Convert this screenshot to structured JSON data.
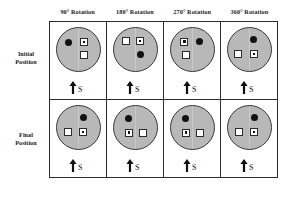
{
  "figure": {
    "column_headers": [
      "90° Rotation",
      "180° Rotation",
      "270° Rotation",
      "360° Rotation"
    ],
    "row_labels": {
      "initial": "Initial\nPosition",
      "initial_line1": "Initial",
      "initial_line2": "Position",
      "final_line1": "Final",
      "final_line2": "Position"
    },
    "marker_label": "S",
    "colors": {
      "disc_fill": "#b8b8b8",
      "disc_stroke": "#3a3a3a",
      "dot_fill": "#111111",
      "square_fill": "#ffffff",
      "square_stroke": "#2b2b2b",
      "grid_line": "#2b2b2b",
      "background": "#ffffff"
    },
    "cells": [
      {
        "row": "Initial Position",
        "column": "90° Rotation",
        "marker": "S",
        "objects": [
          {
            "type": "filled-dot",
            "x": 28,
            "y": 33
          },
          {
            "type": "square-with-dot",
            "x": 64,
            "y": 33
          },
          {
            "type": "plain-square",
            "x": 64,
            "y": 63
          }
        ]
      },
      {
        "row": "Initial Position",
        "column": "180° Rotation",
        "marker": "S",
        "objects": [
          {
            "type": "plain-square",
            "x": 30,
            "y": 30
          },
          {
            "type": "square-with-dot",
            "x": 62,
            "y": 30
          },
          {
            "type": "filled-dot",
            "x": 62,
            "y": 62
          }
        ]
      },
      {
        "row": "Initial Position",
        "column": "270° Rotation",
        "marker": "S",
        "objects": [
          {
            "type": "square-with-dot",
            "x": 32,
            "y": 32
          },
          {
            "type": "filled-dot",
            "x": 67,
            "y": 31
          },
          {
            "type": "plain-square",
            "x": 36,
            "y": 63
          }
        ]
      },
      {
        "row": "Initial Position",
        "column": "360° Rotation",
        "marker": "S",
        "objects": [
          {
            "type": "filled-dot",
            "x": 60,
            "y": 27
          },
          {
            "type": "plain-square",
            "x": 25,
            "y": 60
          },
          {
            "type": "square-with-dot",
            "x": 62,
            "y": 60
          }
        ]
      },
      {
        "row": "Final Position",
        "column": "90° Rotation",
        "marker": "S",
        "objects": [
          {
            "type": "filled-dot",
            "x": 62,
            "y": 27
          },
          {
            "type": "plain-square",
            "x": 26,
            "y": 60
          },
          {
            "type": "square-with-dot",
            "x": 62,
            "y": 60
          }
        ]
      },
      {
        "row": "Final Position",
        "column": "180° Rotation",
        "marker": "S",
        "objects": [
          {
            "type": "filled-dot",
            "x": 36,
            "y": 28
          },
          {
            "type": "square-with-dot",
            "x": 36,
            "y": 62
          },
          {
            "type": "plain-square",
            "x": 68,
            "y": 62
          }
        ]
      },
      {
        "row": "Final Position",
        "column": "270° Rotation",
        "marker": "S",
        "objects": [
          {
            "type": "filled-dot",
            "x": 34,
            "y": 28
          },
          {
            "type": "square-with-dot",
            "x": 36,
            "y": 62
          },
          {
            "type": "plain-square",
            "x": 68,
            "y": 62
          }
        ]
      },
      {
        "row": "Final Position",
        "column": "360° Rotation",
        "marker": "S",
        "objects": [
          {
            "type": "filled-dot",
            "x": 62,
            "y": 27
          },
          {
            "type": "plain-square",
            "x": 26,
            "y": 60
          },
          {
            "type": "square-with-dot",
            "x": 62,
            "y": 60
          }
        ]
      }
    ]
  }
}
